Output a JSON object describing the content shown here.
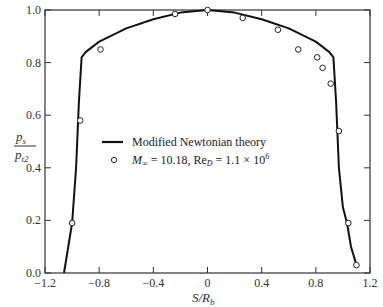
{
  "chart_data": {
    "type": "line",
    "title": "",
    "xlabel": "S/R_b",
    "ylabel": "p_s / p_t2",
    "xlim": [
      -1.2,
      1.2
    ],
    "ylim": [
      0.0,
      1.0
    ],
    "grid": false,
    "legend_position": "center",
    "x_ticks": [
      "-1.2",
      "-0.8",
      "-0.4",
      "0",
      "0.4",
      "0.8",
      "1.2"
    ],
    "y_ticks": [
      "0.0",
      "0.2",
      "0.4",
      "0.6",
      "0.8",
      "1.0"
    ],
    "series": [
      {
        "name": "Modified Newtonian theory",
        "style": "solid line",
        "x": [
          -1.06,
          -1.0,
          -0.97,
          -0.95,
          -0.93,
          -0.9,
          -0.8,
          -0.6,
          -0.4,
          -0.2,
          0.0,
          0.2,
          0.4,
          0.6,
          0.8,
          0.9,
          0.93,
          0.95,
          0.97,
          1.0,
          1.03,
          1.06,
          1.1
        ],
        "y": [
          0.0,
          0.19,
          0.4,
          0.65,
          0.82,
          0.84,
          0.88,
          0.93,
          0.965,
          0.99,
          1.0,
          0.99,
          0.965,
          0.93,
          0.88,
          0.84,
          0.82,
          0.65,
          0.4,
          0.25,
          0.19,
          0.1,
          0.03
        ]
      },
      {
        "name": "M∞ = 10.18, Re_D = 1.1 × 10^6",
        "style": "open circle markers",
        "x": [
          -1.0,
          -0.94,
          -0.79,
          -0.24,
          0.0,
          0.26,
          0.52,
          0.67,
          0.81,
          0.85,
          0.91,
          0.97,
          1.04,
          1.1
        ],
        "y": [
          0.19,
          0.58,
          0.85,
          0.985,
          1.0,
          0.97,
          0.925,
          0.85,
          0.82,
          0.78,
          0.72,
          0.54,
          0.19,
          0.03
        ]
      }
    ]
  },
  "labels": {
    "xlabel_main": "S/R",
    "xlabel_sub": "b",
    "ylabel_num_main": "p",
    "ylabel_num_sub": "s",
    "ylabel_den_main": "p",
    "ylabel_den_sub": "t2",
    "legend_line": "Modified Newtonian theory",
    "legend_marker_prefix": "M",
    "legend_marker_sub1": "∞",
    "legend_marker_mid": " = 10.18, Re",
    "legend_marker_sub2": "D",
    "legend_marker_suffix": " = 1.1 × 10",
    "legend_marker_sup": "6"
  }
}
